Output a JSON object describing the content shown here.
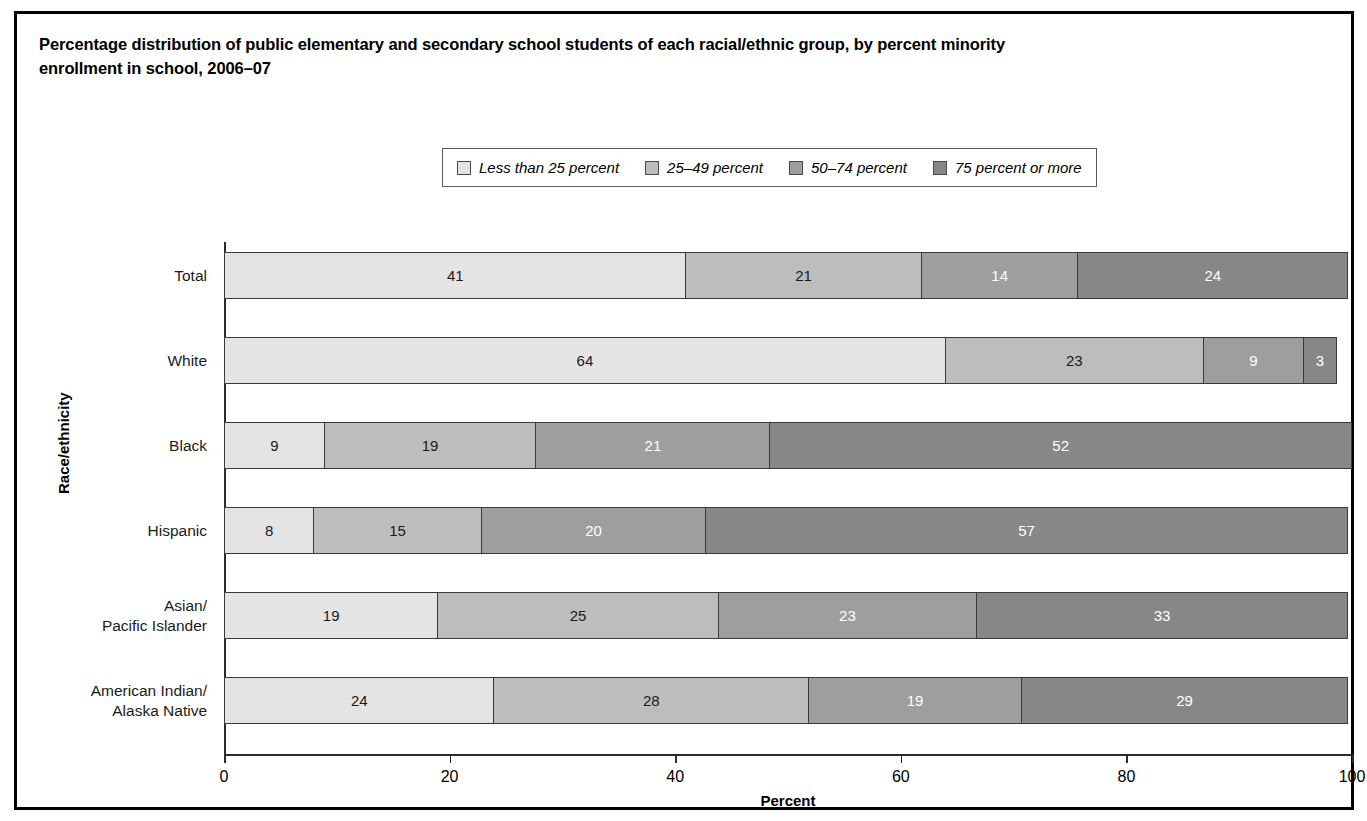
{
  "title": {
    "line1": "Percentage distribution of public elementary and secondary school students of each racial/ethnic group, by percent minority",
    "line2": "enrollment in school, 2006–07"
  },
  "legend": {
    "items": [
      {
        "label": "Less than 25 percent",
        "color": "#e4e4e4"
      },
      {
        "label": "25–49 percent",
        "color": "#bdbdbd"
      },
      {
        "label": "50–74 percent",
        "color": "#9e9e9e"
      },
      {
        "label": "75 percent or more",
        "color": "#878787"
      }
    ]
  },
  "axes": {
    "x_title": "Percent",
    "y_title": "Race/ethnicity",
    "x_ticks": [
      "0",
      "20",
      "40",
      "60",
      "80",
      "100"
    ],
    "x_tick_values": [
      0,
      20,
      40,
      60,
      80,
      100
    ],
    "xlim": [
      0,
      100
    ]
  },
  "chart_data": {
    "type": "bar",
    "orientation": "horizontal",
    "stacked": true,
    "title": "Percentage distribution of public elementary and secondary school students of each racial/ethnic group, by percent minority enrollment in school, 2006–07",
    "xlabel": "Percent",
    "ylabel": "Race/ethnicity",
    "xlim": [
      0,
      100
    ],
    "grid": false,
    "legend_position": "top-center",
    "categories": [
      "Total",
      "White",
      "Black",
      "Hispanic",
      "Asian/\nPacific Islander",
      "American Indian/\nAlaska Native"
    ],
    "series": [
      {
        "name": "Less than 25 percent",
        "color": "#e4e4e4",
        "values": [
          41,
          64,
          9,
          8,
          19,
          24
        ]
      },
      {
        "name": "25–49 percent",
        "color": "#bdbdbd",
        "values": [
          21,
          23,
          19,
          15,
          25,
          28
        ]
      },
      {
        "name": "50–74 percent",
        "color": "#9e9e9e",
        "values": [
          14,
          9,
          21,
          20,
          23,
          19
        ]
      },
      {
        "name": "75 percent or more",
        "color": "#878787",
        "values": [
          24,
          3,
          52,
          57,
          33,
          29
        ]
      }
    ]
  },
  "rows": [
    {
      "label_lines": [
        "Total"
      ],
      "segments": [
        {
          "value": 41,
          "text": "41",
          "color": "#e4e4e4",
          "text_color": "#1a1a1a"
        },
        {
          "value": 21,
          "text": "21",
          "color": "#bdbdbd",
          "text_color": "#1a1a1a"
        },
        {
          "value": 14,
          "text": "14",
          "color": "#9e9e9e",
          "text_color": "#ffffff"
        },
        {
          "value": 24,
          "text": "24",
          "color": "#878787",
          "text_color": "#ffffff"
        }
      ]
    },
    {
      "label_lines": [
        "White"
      ],
      "segments": [
        {
          "value": 64,
          "text": "64",
          "color": "#e4e4e4",
          "text_color": "#1a1a1a"
        },
        {
          "value": 23,
          "text": "23",
          "color": "#bdbdbd",
          "text_color": "#1a1a1a"
        },
        {
          "value": 9,
          "text": "9",
          "color": "#9e9e9e",
          "text_color": "#ffffff"
        },
        {
          "value": 3,
          "text": "3",
          "color": "#878787",
          "text_color": "#ffffff"
        }
      ]
    },
    {
      "label_lines": [
        "Black"
      ],
      "segments": [
        {
          "value": 9,
          "text": "9",
          "color": "#e4e4e4",
          "text_color": "#1a1a1a"
        },
        {
          "value": 19,
          "text": "19",
          "color": "#bdbdbd",
          "text_color": "#1a1a1a"
        },
        {
          "value": 21,
          "text": "21",
          "color": "#9e9e9e",
          "text_color": "#ffffff"
        },
        {
          "value": 52,
          "text": "52",
          "color": "#878787",
          "text_color": "#ffffff"
        }
      ]
    },
    {
      "label_lines": [
        "Hispanic"
      ],
      "segments": [
        {
          "value": 8,
          "text": "8",
          "color": "#e4e4e4",
          "text_color": "#1a1a1a"
        },
        {
          "value": 15,
          "text": "15",
          "color": "#bdbdbd",
          "text_color": "#1a1a1a"
        },
        {
          "value": 20,
          "text": "20",
          "color": "#9e9e9e",
          "text_color": "#ffffff"
        },
        {
          "value": 57,
          "text": "57",
          "color": "#878787",
          "text_color": "#ffffff"
        }
      ]
    },
    {
      "label_lines": [
        "Asian/",
        "Pacific Islander"
      ],
      "segments": [
        {
          "value": 19,
          "text": "19",
          "color": "#e4e4e4",
          "text_color": "#1a1a1a"
        },
        {
          "value": 25,
          "text": "25",
          "color": "#bdbdbd",
          "text_color": "#1a1a1a"
        },
        {
          "value": 23,
          "text": "23",
          "color": "#9e9e9e",
          "text_color": "#ffffff"
        },
        {
          "value": 33,
          "text": "33",
          "color": "#878787",
          "text_color": "#ffffff"
        }
      ]
    },
    {
      "label_lines": [
        "American Indian/",
        "Alaska Native"
      ],
      "segments": [
        {
          "value": 24,
          "text": "24",
          "color": "#e4e4e4",
          "text_color": "#1a1a1a"
        },
        {
          "value": 28,
          "text": "28",
          "color": "#bdbdbd",
          "text_color": "#1a1a1a"
        },
        {
          "value": 19,
          "text": "19",
          "color": "#9e9e9e",
          "text_color": "#ffffff"
        },
        {
          "value": 29,
          "text": "29",
          "color": "#878787",
          "text_color": "#ffffff"
        }
      ]
    }
  ]
}
